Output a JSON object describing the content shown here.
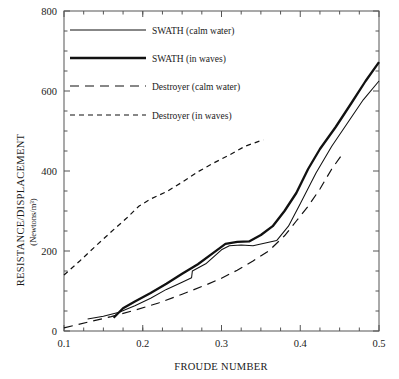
{
  "chart_data": {
    "type": "line",
    "title": "",
    "xlabel": "FROUDE NUMBER",
    "ylabel": "RESISTANCE/DISPLACEMENT",
    "ylabel_units": "(Newtons/m³)",
    "xlim": [
      0.1,
      0.5
    ],
    "ylim": [
      0,
      800
    ],
    "xticks": [
      0.1,
      0.2,
      0.3,
      0.4,
      0.5
    ],
    "xtick_labels": [
      "0.1",
      "0.2",
      "0.3",
      "0.4",
      "0.5"
    ],
    "yticks": [
      0,
      200,
      400,
      600,
      800
    ],
    "ytick_labels": [
      "0",
      "200",
      "400",
      "600",
      "800"
    ],
    "minor_yticks": [
      50,
      100,
      150,
      250,
      300,
      350,
      450,
      500,
      550,
      650,
      700,
      750
    ],
    "grid": false,
    "legend_position": "upper-left-inside",
    "series": [
      {
        "name": "SWATH (calm water)",
        "style": "solid-thin",
        "points": [
          [
            0.13,
            30
          ],
          [
            0.15,
            37
          ],
          [
            0.17,
            47
          ],
          [
            0.19,
            63
          ],
          [
            0.21,
            82
          ],
          [
            0.23,
            104
          ],
          [
            0.25,
            122
          ],
          [
            0.262,
            133
          ],
          [
            0.263,
            150
          ],
          [
            0.28,
            168
          ],
          [
            0.3,
            203
          ],
          [
            0.31,
            213
          ],
          [
            0.325,
            215
          ],
          [
            0.34,
            213
          ],
          [
            0.36,
            222
          ],
          [
            0.37,
            226
          ],
          [
            0.385,
            262
          ],
          [
            0.4,
            318
          ],
          [
            0.42,
            395
          ],
          [
            0.44,
            462
          ],
          [
            0.46,
            520
          ],
          [
            0.48,
            578
          ],
          [
            0.5,
            625
          ]
        ]
      },
      {
        "name": "SWATH (in waves)",
        "style": "solid-bold",
        "points": [
          [
            0.163,
            33
          ],
          [
            0.175,
            57
          ],
          [
            0.19,
            74
          ],
          [
            0.21,
            95
          ],
          [
            0.23,
            118
          ],
          [
            0.25,
            143
          ],
          [
            0.27,
            167
          ],
          [
            0.29,
            196
          ],
          [
            0.305,
            218
          ],
          [
            0.32,
            223
          ],
          [
            0.335,
            224
          ],
          [
            0.35,
            240
          ],
          [
            0.365,
            262
          ],
          [
            0.38,
            300
          ],
          [
            0.395,
            345
          ],
          [
            0.41,
            405
          ],
          [
            0.425,
            455
          ],
          [
            0.445,
            510
          ],
          [
            0.465,
            570
          ],
          [
            0.483,
            625
          ],
          [
            0.5,
            672
          ]
        ]
      },
      {
        "name": "Destroyer (calm water)",
        "style": "dashed-long",
        "points": [
          [
            0.1,
            8
          ],
          [
            0.13,
            22
          ],
          [
            0.16,
            36
          ],
          [
            0.19,
            52
          ],
          [
            0.22,
            70
          ],
          [
            0.25,
            92
          ],
          [
            0.28,
            115
          ],
          [
            0.3,
            132
          ],
          [
            0.32,
            152
          ],
          [
            0.34,
            175
          ],
          [
            0.36,
            200
          ],
          [
            0.38,
            238
          ],
          [
            0.395,
            275
          ],
          [
            0.41,
            312
          ],
          [
            0.425,
            355
          ],
          [
            0.44,
            405
          ],
          [
            0.452,
            438
          ]
        ]
      },
      {
        "name": "Destroyer (in waves)",
        "style": "dashed-short",
        "points": [
          [
            0.1,
            140
          ],
          [
            0.12,
            175
          ],
          [
            0.14,
            212
          ],
          [
            0.16,
            248
          ],
          [
            0.18,
            283
          ],
          [
            0.195,
            312
          ],
          [
            0.21,
            330
          ],
          [
            0.23,
            348
          ],
          [
            0.25,
            372
          ],
          [
            0.27,
            398
          ],
          [
            0.29,
            420
          ],
          [
            0.31,
            440
          ],
          [
            0.33,
            462
          ],
          [
            0.353,
            478
          ]
        ]
      }
    ]
  },
  "legend": {
    "entries": [
      {
        "label": "SWATH (calm water)",
        "style": "solid-thin"
      },
      {
        "label": "SWATH (in waves)",
        "style": "solid-bold"
      },
      {
        "label": "Destroyer (calm water)",
        "style": "dashed-long"
      },
      {
        "label": "Destroyer (in waves)",
        "style": "dashed-short"
      }
    ]
  }
}
